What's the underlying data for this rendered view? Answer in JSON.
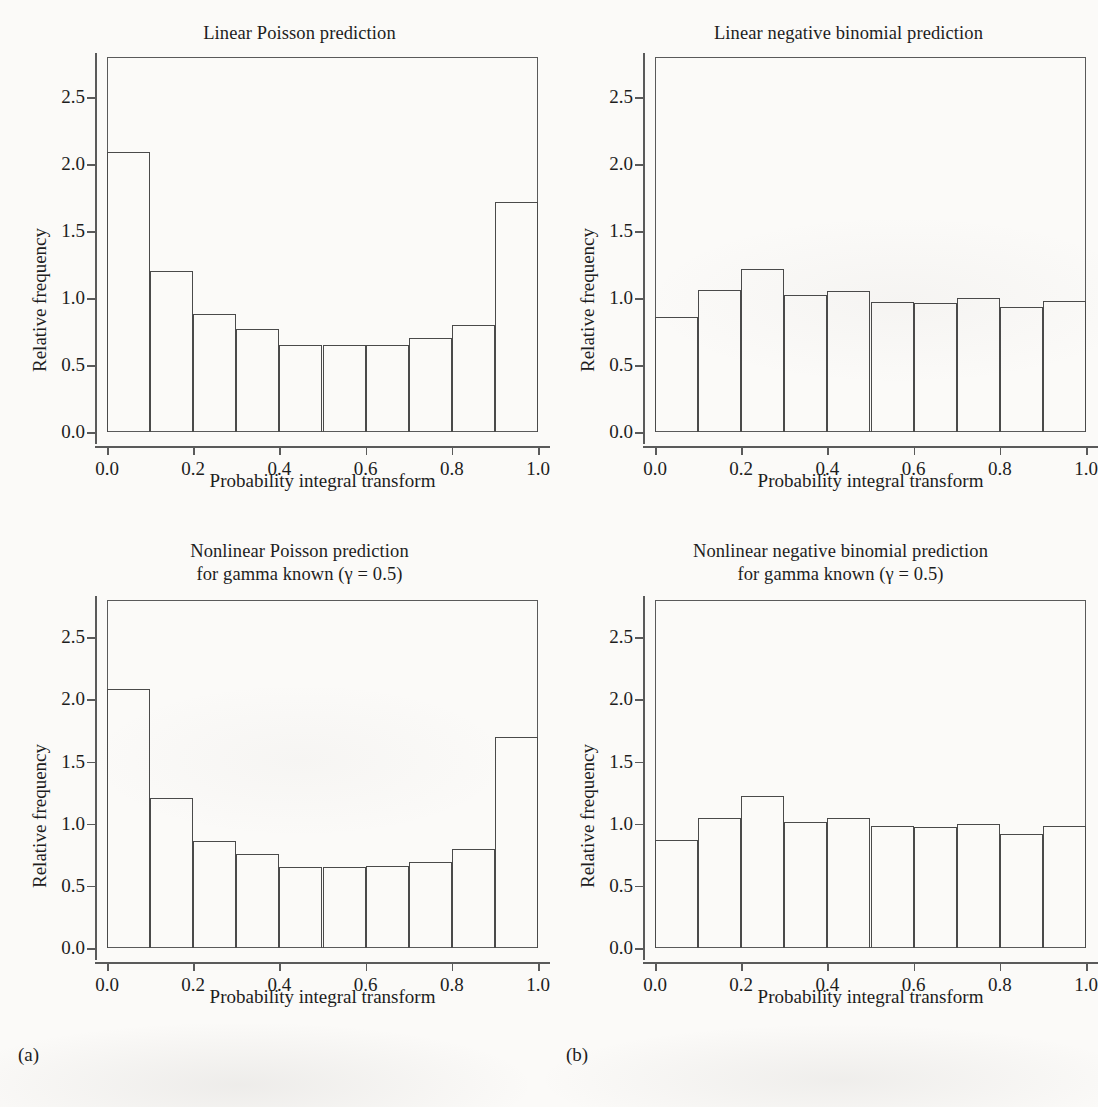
{
  "figure": {
    "subfigure_a_label": "(a)",
    "subfigure_b_label": "(b)",
    "axis_label_x": "Probability integral transform",
    "axis_label_y": "Relative frequency"
  },
  "chart_data": [
    {
      "id": "top-left",
      "type": "bar",
      "title": "Linear Poisson prediction",
      "xlabel": "Probability integral transform",
      "ylabel": "Relative frequency",
      "xlim": [
        0.0,
        1.0
      ],
      "ylim": [
        0.0,
        2.8
      ],
      "xticks": [
        "0.0",
        "0.2",
        "0.4",
        "0.6",
        "0.8",
        "1.0"
      ],
      "xtick_values": [
        0.0,
        0.2,
        0.4,
        0.6,
        0.8,
        1.0
      ],
      "yticks": [
        "0.0",
        "0.5",
        "1.0",
        "1.5",
        "2.0",
        "2.5"
      ],
      "ytick_values": [
        0.0,
        0.5,
        1.0,
        1.5,
        2.0,
        2.5
      ],
      "grid": false,
      "legend": "none",
      "bin_edges": [
        0.0,
        0.1,
        0.2,
        0.3,
        0.4,
        0.5,
        0.6,
        0.7,
        0.8,
        0.9,
        1.0
      ],
      "categories": [
        "0.0-0.1",
        "0.1-0.2",
        "0.2-0.3",
        "0.3-0.4",
        "0.4-0.5",
        "0.5-0.6",
        "0.6-0.7",
        "0.7-0.8",
        "0.8-0.9",
        "0.9-1.0"
      ],
      "values": [
        2.09,
        1.2,
        0.88,
        0.77,
        0.65,
        0.65,
        0.65,
        0.7,
        0.8,
        1.72
      ]
    },
    {
      "id": "top-right",
      "type": "bar",
      "title": "Linear negative binomial prediction",
      "xlabel": "Probability integral transform",
      "ylabel": "Relative frequency",
      "xlim": [
        0.0,
        1.0
      ],
      "ylim": [
        0.0,
        2.8
      ],
      "xticks": [
        "0.0",
        "0.2",
        "0.4",
        "0.6",
        "0.8",
        "1.0"
      ],
      "xtick_values": [
        0.0,
        0.2,
        0.4,
        0.6,
        0.8,
        1.0
      ],
      "yticks": [
        "0.0",
        "0.5",
        "1.0",
        "1.5",
        "2.0",
        "2.5"
      ],
      "ytick_values": [
        0.0,
        0.5,
        1.0,
        1.5,
        2.0,
        2.5
      ],
      "grid": false,
      "legend": "none",
      "bin_edges": [
        0.0,
        0.1,
        0.2,
        0.3,
        0.4,
        0.5,
        0.6,
        0.7,
        0.8,
        0.9,
        1.0
      ],
      "categories": [
        "0.0-0.1",
        "0.1-0.2",
        "0.2-0.3",
        "0.3-0.4",
        "0.4-0.5",
        "0.5-0.6",
        "0.6-0.7",
        "0.7-0.8",
        "0.8-0.9",
        "0.9-1.0"
      ],
      "values": [
        0.86,
        1.06,
        1.22,
        1.02,
        1.05,
        0.97,
        0.96,
        1.0,
        0.93,
        0.98
      ]
    },
    {
      "id": "bottom-left",
      "type": "bar",
      "title": "Nonlinear Poisson prediction\nfor gamma known (γ = 0.5)",
      "xlabel": "Probability integral transform",
      "ylabel": "Relative frequency",
      "xlim": [
        0.0,
        1.0
      ],
      "ylim": [
        0.0,
        2.8
      ],
      "xticks": [
        "0.0",
        "0.2",
        "0.4",
        "0.6",
        "0.8",
        "1.0"
      ],
      "xtick_values": [
        0.0,
        0.2,
        0.4,
        0.6,
        0.8,
        1.0
      ],
      "yticks": [
        "0.0",
        "0.5",
        "1.0",
        "1.5",
        "2.0",
        "2.5"
      ],
      "ytick_values": [
        0.0,
        0.5,
        1.0,
        1.5,
        2.0,
        2.5
      ],
      "grid": false,
      "legend": "none",
      "bin_edges": [
        0.0,
        0.1,
        0.2,
        0.3,
        0.4,
        0.5,
        0.6,
        0.7,
        0.8,
        0.9,
        1.0
      ],
      "categories": [
        "0.0-0.1",
        "0.1-0.2",
        "0.2-0.3",
        "0.3-0.4",
        "0.4-0.5",
        "0.5-0.6",
        "0.6-0.7",
        "0.7-0.8",
        "0.8-0.9",
        "0.9-1.0"
      ],
      "values": [
        2.08,
        1.21,
        0.86,
        0.76,
        0.65,
        0.65,
        0.66,
        0.69,
        0.8,
        1.7
      ]
    },
    {
      "id": "bottom-right",
      "type": "bar",
      "title": "Nonlinear negative binomial prediction\nfor gamma known (γ = 0.5)",
      "xlabel": "Probability integral transform",
      "ylabel": "Relative frequency",
      "xlim": [
        0.0,
        1.0
      ],
      "ylim": [
        0.0,
        2.8
      ],
      "xticks": [
        "0.0",
        "0.2",
        "0.4",
        "0.6",
        "0.8",
        "1.0"
      ],
      "xtick_values": [
        0.0,
        0.2,
        0.4,
        0.6,
        0.8,
        1.0
      ],
      "yticks": [
        "0.0",
        "0.5",
        "1.0",
        "1.5",
        "2.0",
        "2.5"
      ],
      "ytick_values": [
        0.0,
        0.5,
        1.0,
        1.5,
        2.0,
        2.5
      ],
      "grid": false,
      "legend": "none",
      "bin_edges": [
        0.0,
        0.1,
        0.2,
        0.3,
        0.4,
        0.5,
        0.6,
        0.7,
        0.8,
        0.9,
        1.0
      ],
      "categories": [
        "0.0-0.1",
        "0.1-0.2",
        "0.2-0.3",
        "0.3-0.4",
        "0.4-0.5",
        "0.5-0.6",
        "0.6-0.7",
        "0.7-0.8",
        "0.8-0.9",
        "0.9-1.0"
      ],
      "values": [
        0.87,
        1.05,
        1.22,
        1.01,
        1.05,
        0.98,
        0.97,
        1.0,
        0.92,
        0.98
      ]
    }
  ]
}
